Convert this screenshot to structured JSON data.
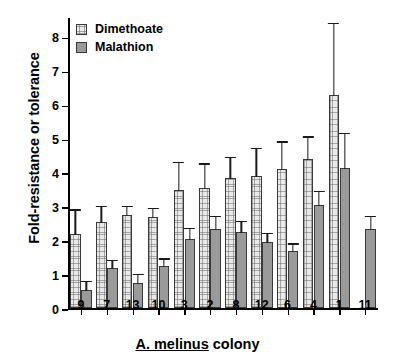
{
  "chart_data": {
    "type": "bar",
    "title": "",
    "xlabel": "A. melinus colony",
    "ylabel": "Fold-resistance or tolerance",
    "categories": [
      "9",
      "7",
      "13",
      "10",
      "3",
      "2",
      "8",
      "12",
      "6",
      "4",
      "1",
      "11"
    ],
    "ylim": [
      0,
      8.6
    ],
    "yticks": [
      0,
      1,
      2,
      3,
      4,
      5,
      6,
      7,
      8
    ],
    "grid": false,
    "legend_position": "top-left",
    "series": [
      {
        "name": "Dimethoate",
        "color": "#ececec",
        "values": [
          2.2,
          2.55,
          2.75,
          2.7,
          3.5,
          3.55,
          3.85,
          3.9,
          4.1,
          4.4,
          6.3,
          null
        ],
        "errors_upper": [
          2.95,
          3.05,
          3.05,
          3.0,
          4.35,
          4.3,
          4.5,
          4.75,
          4.95,
          5.1,
          8.45,
          null
        ]
      },
      {
        "name": "Malathion",
        "color": "#9a9a9a",
        "values": [
          0.55,
          1.2,
          0.75,
          1.25,
          2.05,
          2.35,
          2.25,
          1.95,
          1.7,
          3.05,
          4.15,
          2.35
        ],
        "errors_upper": [
          0.85,
          1.45,
          1.05,
          1.5,
          2.4,
          2.75,
          2.6,
          2.25,
          1.95,
          3.5,
          5.2,
          2.75
        ]
      }
    ]
  },
  "legend": {
    "items": [
      {
        "label": "Dimethoate"
      },
      {
        "label": "Malathion"
      }
    ]
  },
  "axis": {
    "x_title_italic": "A. melinus",
    "x_title_rest": " colony",
    "y_title": "Fold-resistance or tolerance"
  }
}
